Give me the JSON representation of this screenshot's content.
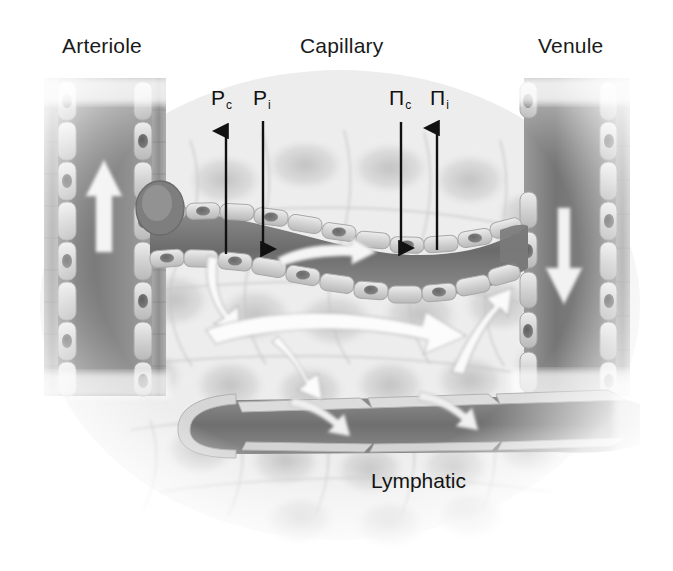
{
  "figure": {
    "width": 673,
    "height": 571,
    "background_color": "#ffffff",
    "style": "grayscale medical illustration"
  },
  "vessel_labels": [
    {
      "id": "arteriole",
      "text": "Arteriole",
      "x": 108,
      "y": 46
    },
    {
      "id": "capillary",
      "text": "Capillary",
      "x": 346,
      "y": 46
    },
    {
      "id": "venule",
      "text": "Venule",
      "x": 578,
      "y": 46
    }
  ],
  "force_labels": [
    {
      "id": "pc",
      "symbol": "P",
      "subscript": "c",
      "full_text": "Pc",
      "meaning": "capillary hydrostatic pressure",
      "x": 222,
      "y": 100,
      "arrow_direction": "up",
      "arrow_x": 226,
      "arrow_top": 127,
      "arrow_bottom": 254
    },
    {
      "id": "pi",
      "symbol": "P",
      "subscript": "i",
      "full_text": "Pi",
      "meaning": "interstitial hydrostatic pressure",
      "x": 263,
      "y": 100,
      "arrow_direction": "down",
      "arrow_x": 263,
      "arrow_top": 121,
      "arrow_bottom": 253
    },
    {
      "id": "pic",
      "symbol": "Π",
      "subscript": "c",
      "full_text": "Πc",
      "meaning": "capillary oncotic pressure",
      "x": 400,
      "y": 100,
      "arrow_direction": "down",
      "arrow_x": 401,
      "arrow_top": 122,
      "arrow_bottom": 252
    },
    {
      "id": "pii",
      "symbol": "Π",
      "subscript": "i",
      "full_text": "Πi",
      "meaning": "interstitial oncotic pressure",
      "x": 440,
      "y": 100,
      "arrow_direction": "up",
      "arrow_x": 437,
      "arrow_top": 124,
      "arrow_bottom": 250
    }
  ],
  "lymphatic_label": {
    "id": "lymphatic",
    "text": "Lymphatic",
    "x": 425,
    "y": 481
  },
  "flow_arrows": [
    {
      "id": "arteriole-flow",
      "direction": "up",
      "location": "arteriole lumen",
      "color": "#f2f2f2"
    },
    {
      "id": "capillary-flow",
      "direction": "right",
      "location": "capillary lumen",
      "color": "#f5f5f5"
    },
    {
      "id": "venule-flow",
      "direction": "down",
      "location": "venule lumen",
      "color": "#f2f2f2"
    },
    {
      "id": "filtration-flow",
      "direction": "down-left",
      "location": "arterial end of capillary",
      "color": "#fafafa"
    },
    {
      "id": "reabsorption-flow",
      "direction": "up-right",
      "location": "venous end of capillary",
      "color": "#fafafa"
    },
    {
      "id": "interstitial-flow-main",
      "direction": "right",
      "location": "interstitium",
      "color": "#fcfcfc"
    },
    {
      "id": "interstitial-flow-branch",
      "direction": "down",
      "location": "interstitium",
      "color": "#fcfcfc"
    },
    {
      "id": "lymph-uptake-1",
      "direction": "right",
      "location": "lymphatic flap",
      "color": "#f0f0f0"
    },
    {
      "id": "lymph-uptake-2",
      "direction": "right",
      "location": "lymphatic flap",
      "color": "#f0f0f0"
    }
  ],
  "palette": {
    "label_text": "#1a1a1a",
    "arrow_black": "#111111",
    "vessel_wall_light": "#d8d8d8",
    "vessel_wall_mid": "#b4b4b4",
    "vessel_lumen_dark": "#6e6e6e",
    "lumen_mid": "#8c8c8c",
    "nucleus": "#6a6a6a",
    "tissue_light": "#ececec",
    "tissue_outline": "#c9c9c9",
    "smooth_muscle": "#9a9a9a",
    "background": "#ffffff"
  }
}
